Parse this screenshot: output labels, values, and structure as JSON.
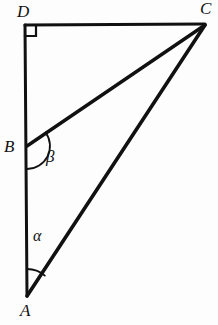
{
  "figure": {
    "background_color": "#fdfdfd",
    "stroke_color": "#111111",
    "canvas": {
      "width": 218,
      "height": 325
    },
    "vertices": [
      {
        "id": "D",
        "label": "D",
        "x": 25,
        "y": 25,
        "label_x": 17,
        "label_y": 3
      },
      {
        "id": "C",
        "label": "C",
        "x": 205,
        "y": 24,
        "label_x": 200,
        "label_y": 0
      },
      {
        "id": "B",
        "label": "B",
        "x": 27,
        "y": 146,
        "label_x": 4,
        "label_y": 138
      },
      {
        "id": "A",
        "label": "A",
        "x": 27,
        "y": 296,
        "label_x": 20,
        "label_y": 302
      }
    ],
    "segments": [
      {
        "id": "DC",
        "from": "D",
        "to": "C",
        "x1": 25,
        "y1": 25,
        "x2": 205,
        "y2": 24,
        "width": 3.2
      },
      {
        "id": "DA",
        "from": "D",
        "to": "A",
        "x1": 25,
        "y1": 25,
        "x2": 27,
        "y2": 296,
        "width": 3.0
      },
      {
        "id": "BC",
        "from": "B",
        "to": "C",
        "x1": 27,
        "y1": 146,
        "x2": 205,
        "y2": 25,
        "width": 3.4
      },
      {
        "id": "AC",
        "from": "A",
        "to": "C",
        "x1": 27,
        "y1": 296,
        "x2": 205,
        "y2": 25,
        "width": 3.6
      }
    ],
    "right_angle": {
      "at": "D",
      "marker": "square",
      "x": 25,
      "y": 25,
      "size": 11,
      "width": 2.2
    },
    "angles": [
      {
        "id": "alpha",
        "label": "α",
        "at": "A",
        "vertex_x": 27,
        "vertex_y": 296,
        "radius": 27,
        "arc_path": "M 27 269 A 27 27 0 0 1 44.8 275.6",
        "label_x": 33,
        "label_y": 228,
        "width": 1.8
      },
      {
        "id": "beta",
        "label": "β",
        "at": "B",
        "vertex_x": 27,
        "vertex_y": 146,
        "radius": 23,
        "arc_path": "M 45.6 132.5 A 23 23 0 0 1 27.2 169",
        "label_x": 46,
        "label_y": 148,
        "width": 1.8
      }
    ]
  }
}
